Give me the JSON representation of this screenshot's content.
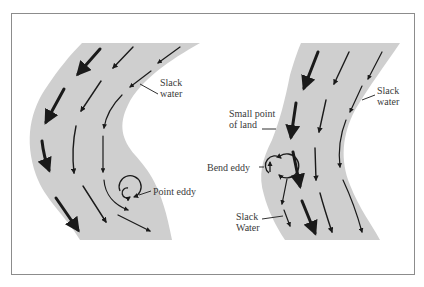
{
  "figure": {
    "colors": {
      "river_fill": "#cfcfcf",
      "arrow": "#1a1a1a",
      "frame": "#8c8c8c",
      "background": "#ffffff",
      "label_text": "#3a3a3a"
    },
    "left_panel": {
      "title": "River bend with point eddy",
      "labels": {
        "slack_water_line1": "Slack",
        "slack_water_line2": "water",
        "point_eddy": "Point eddy"
      }
    },
    "right_panel": {
      "title": "River bend with bend eddy",
      "labels": {
        "small_point_line1": "Small point",
        "small_point_line2": "of land",
        "slack_water_top_line1": "Slack",
        "slack_water_top_line2": "water",
        "bend_eddy": "Bend eddy",
        "slack_water_bottom_line1": "Slack",
        "slack_water_bottom_line2": "Water"
      }
    }
  }
}
